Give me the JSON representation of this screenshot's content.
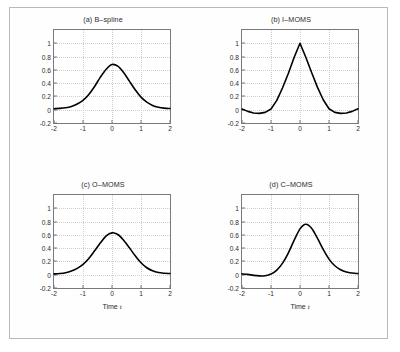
{
  "figure": {
    "layout": "2x2 grid of line plots",
    "xlabel": "Time",
    "xlabel_var": "t"
  },
  "axes": {
    "xticks": [
      "-2",
      "-1",
      "0",
      "1",
      "2"
    ],
    "xtick_values": [
      -2,
      -1,
      0,
      1,
      2
    ],
    "yticks": [
      "-0.2",
      "0",
      "0.2",
      "0.4",
      "0.6",
      "0.8",
      "1"
    ],
    "ytick_values": [
      -0.2,
      0,
      0.2,
      0.4,
      0.6,
      0.8,
      1
    ],
    "xlim": [
      -2,
      2
    ],
    "ylim": [
      -0.2,
      1.2
    ],
    "grid": true
  },
  "colors": {
    "curve": "#000000",
    "frame": "#7a7a7a",
    "grid": "#cfcfcf",
    "outer_border": "#b9b9b9",
    "background": "#ffffff",
    "text": "#2b2b2b"
  },
  "chart_data": [
    {
      "type": "line",
      "panel": "a",
      "title": "(a) B–spline",
      "xlabel": "",
      "ylabel": "",
      "xlim": [
        -2,
        2
      ],
      "ylim": [
        -0.2,
        1.2
      ],
      "grid": true,
      "legend": null,
      "x": [
        -2,
        -1.8,
        -1.6,
        -1.4,
        -1.2,
        -1,
        -0.8,
        -0.6,
        -0.4,
        -0.2,
        0,
        0.2,
        0.4,
        0.6,
        0.8,
        1,
        1.2,
        1.4,
        1.6,
        1.8,
        2
      ],
      "values": [
        0.015,
        0.02,
        0.03,
        0.05,
        0.085,
        0.14,
        0.23,
        0.35,
        0.49,
        0.61,
        0.68,
        0.655,
        0.56,
        0.43,
        0.3,
        0.19,
        0.115,
        0.065,
        0.038,
        0.024,
        0.018
      ]
    },
    {
      "type": "line",
      "panel": "b",
      "title": "(b) I–MOMS",
      "xlabel": "",
      "ylabel": "",
      "xlim": [
        -2,
        2
      ],
      "ylim": [
        -0.2,
        1.2
      ],
      "grid": true,
      "legend": null,
      "x": [
        -2,
        -1.8,
        -1.6,
        -1.4,
        -1.2,
        -1,
        -0.8,
        -0.6,
        -0.4,
        -0.2,
        0,
        0.2,
        0.4,
        0.6,
        0.8,
        1,
        1.2,
        1.4,
        1.6,
        1.8,
        2
      ],
      "values": [
        0.01,
        -0.025,
        -0.05,
        -0.055,
        -0.04,
        0.01,
        0.14,
        0.33,
        0.55,
        0.79,
        1.0,
        0.79,
        0.56,
        0.34,
        0.15,
        0.015,
        -0.04,
        -0.055,
        -0.05,
        -0.025,
        0.015
      ]
    },
    {
      "type": "line",
      "panel": "c",
      "title": "(c) O–MOMS",
      "xlabel": "Time t",
      "ylabel": "",
      "xlim": [
        -2,
        2
      ],
      "ylim": [
        -0.2,
        1.2
      ],
      "grid": true,
      "legend": null,
      "x": [
        -2,
        -1.8,
        -1.6,
        -1.4,
        -1.2,
        -1,
        -0.8,
        -0.6,
        -0.4,
        -0.2,
        0,
        0.2,
        0.4,
        0.6,
        0.8,
        1,
        1.2,
        1.4,
        1.6,
        1.8,
        2
      ],
      "values": [
        0.012,
        0.018,
        0.03,
        0.055,
        0.095,
        0.155,
        0.245,
        0.36,
        0.48,
        0.585,
        0.63,
        0.605,
        0.52,
        0.405,
        0.285,
        0.18,
        0.105,
        0.058,
        0.032,
        0.022,
        0.018
      ]
    },
    {
      "type": "line",
      "panel": "d",
      "title": "(d) C–MOMS",
      "xlabel": "Time t",
      "ylabel": "",
      "xlim": [
        -2,
        2
      ],
      "ylim": [
        -0.2,
        1.2
      ],
      "grid": true,
      "legend": null,
      "x": [
        -2,
        -1.8,
        -1.6,
        -1.4,
        -1.2,
        -1,
        -0.8,
        -0.6,
        -0.4,
        -0.2,
        0,
        0.2,
        0.4,
        0.6,
        0.8,
        1,
        1.2,
        1.4,
        1.6,
        1.8,
        2
      ],
      "values": [
        0.012,
        0.005,
        -0.01,
        -0.018,
        -0.015,
        0.01,
        0.07,
        0.175,
        0.33,
        0.52,
        0.69,
        0.76,
        0.7,
        0.55,
        0.38,
        0.235,
        0.135,
        0.075,
        0.04,
        0.025,
        0.018
      ]
    }
  ]
}
